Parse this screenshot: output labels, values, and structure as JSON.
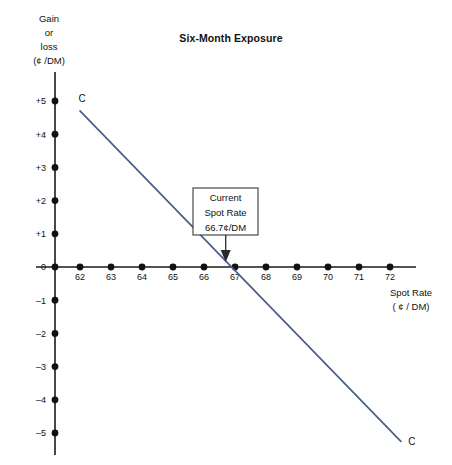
{
  "chart_data": {
    "type": "line",
    "title": "Six-Month Exposure",
    "xlabel_line1": "Spot Rate",
    "xlabel_line2": "( ¢ / DM)",
    "ylabel_line1": "Gain",
    "ylabel_line2": "or",
    "ylabel_line3": "loss",
    "ylabel_line4": "(¢ /DM)",
    "xlim": [
      61.3,
      72.8
    ],
    "ylim": [
      -5.6,
      5.6
    ],
    "grid": false,
    "legend": "none",
    "xticks": [
      "62",
      "63",
      "64",
      "65",
      "66",
      "67",
      "68",
      "69",
      "70",
      "71",
      "72"
    ],
    "xtick_values": [
      62,
      63,
      64,
      65,
      66,
      67,
      68,
      69,
      70,
      71,
      72
    ],
    "yticks": [
      "+5",
      "+4",
      "+3",
      "+2",
      "+1",
      "0",
      "–1",
      "–2",
      "–3",
      "–4",
      "–5"
    ],
    "ytick_values": [
      5,
      4,
      3,
      2,
      1,
      0,
      -1,
      -2,
      -3,
      -4,
      -5
    ],
    "series": [
      {
        "name": "C",
        "label_start": "C",
        "label_end": "C",
        "x": [
          62.0,
          72.35
        ],
        "values": [
          4.7,
          -5.25
        ],
        "zero_crossing": 66.7,
        "slope": -0.96
      }
    ],
    "annotations": [
      {
        "name": "current-spot-rate",
        "line1": "Current",
        "line2": "Spot Rate",
        "line3": "66.7¢/DM",
        "points_to_x": 66.7,
        "points_to_y": 0
      }
    ]
  },
  "colors": {
    "series_line": "#4a5f86",
    "axis": "#1a1a1a",
    "text": "#111111",
    "background": "#ffffff"
  }
}
